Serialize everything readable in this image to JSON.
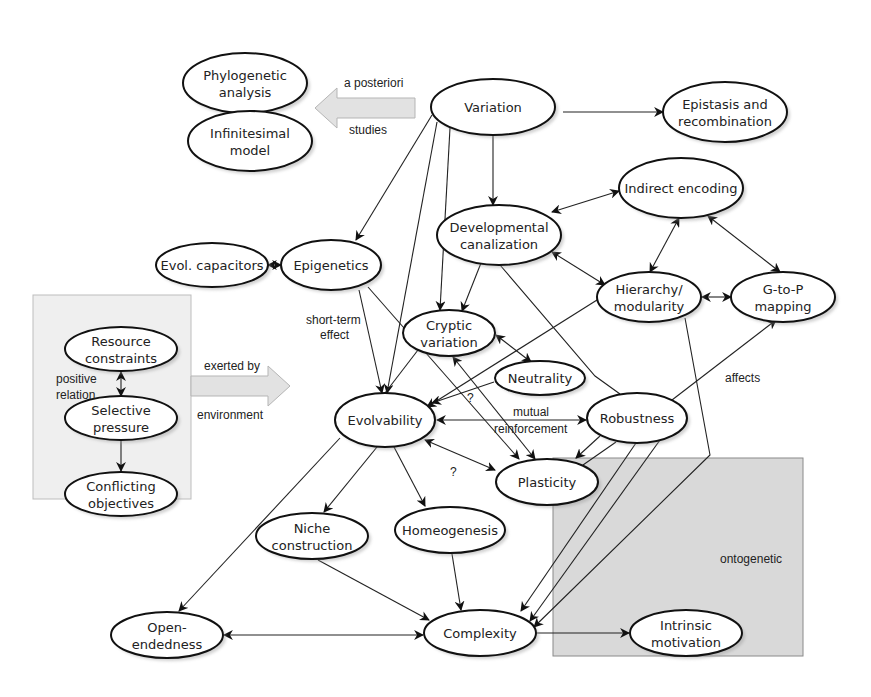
{
  "diagram": {
    "title": "",
    "colors": {
      "background": "#ffffff",
      "node_fill": "#ffffff",
      "node_stroke": "#111111",
      "group_box_fill": "#efefef",
      "ontogenetic_box_fill": "#d9d9d9",
      "block_arrow_fill": "#e2e2e2"
    },
    "nodes": [
      {
        "id": "phylogenetic",
        "lines": [
          "Phylogenetic",
          "analysis"
        ],
        "cx": 245,
        "cy": 83,
        "rx": 62,
        "ry": 30
      },
      {
        "id": "infinitesimal",
        "lines": [
          "Infinitesimal",
          "model"
        ],
        "cx": 250,
        "cy": 141,
        "rx": 62,
        "ry": 30
      },
      {
        "id": "variation",
        "lines": [
          "Variation"
        ],
        "cx": 493,
        "cy": 107,
        "rx": 62,
        "ry": 28
      },
      {
        "id": "epistasis",
        "lines": [
          "Epistasis and",
          "recombination"
        ],
        "cx": 725,
        "cy": 112,
        "rx": 62,
        "ry": 30
      },
      {
        "id": "indirect",
        "lines": [
          "Indirect encoding"
        ],
        "cx": 681,
        "cy": 188,
        "rx": 62,
        "ry": 30
      },
      {
        "id": "canalization",
        "lines": [
          "Developmental",
          "canalization"
        ],
        "cx": 499,
        "cy": 235,
        "rx": 62,
        "ry": 30
      },
      {
        "id": "capacitors",
        "lines": [
          "Evol. capacitors"
        ],
        "cx": 212,
        "cy": 265,
        "rx": 56,
        "ry": 22
      },
      {
        "id": "epigenetics",
        "lines": [
          "Epigenetics"
        ],
        "cx": 331,
        "cy": 265,
        "rx": 50,
        "ry": 25
      },
      {
        "id": "hierarchy",
        "lines": [
          "Hierarchy/",
          "modularity"
        ],
        "cx": 649,
        "cy": 297,
        "rx": 52,
        "ry": 25
      },
      {
        "id": "gtop",
        "lines": [
          "G-to-P",
          "mapping"
        ],
        "cx": 783,
        "cy": 297,
        "rx": 52,
        "ry": 25
      },
      {
        "id": "resource",
        "lines": [
          "Resource",
          "constraints"
        ],
        "cx": 121,
        "cy": 349,
        "rx": 56,
        "ry": 22
      },
      {
        "id": "selective",
        "lines": [
          "Selective",
          "pressure"
        ],
        "cx": 121,
        "cy": 418,
        "rx": 56,
        "ry": 22
      },
      {
        "id": "conflicting",
        "lines": [
          "Conflicting",
          "objectives"
        ],
        "cx": 121,
        "cy": 494,
        "rx": 56,
        "ry": 22
      },
      {
        "id": "cryptic",
        "lines": [
          "Cryptic",
          "variation"
        ],
        "cx": 449,
        "cy": 333,
        "rx": 46,
        "ry": 23
      },
      {
        "id": "neutrality",
        "lines": [
          "Neutrality"
        ],
        "cx": 540,
        "cy": 378,
        "rx": 45,
        "ry": 17
      },
      {
        "id": "evolvability",
        "lines": [
          "Evolvability"
        ],
        "cx": 385,
        "cy": 420,
        "rx": 50,
        "ry": 27
      },
      {
        "id": "robustness",
        "lines": [
          "Robustness"
        ],
        "cx": 637,
        "cy": 418,
        "rx": 50,
        "ry": 25
      },
      {
        "id": "plasticity",
        "lines": [
          "Plasticity"
        ],
        "cx": 547,
        "cy": 482,
        "rx": 51,
        "ry": 23
      },
      {
        "id": "niche",
        "lines": [
          "Niche",
          "construction"
        ],
        "cx": 312,
        "cy": 536,
        "rx": 56,
        "ry": 23
      },
      {
        "id": "homeogenesis",
        "lines": [
          "Homeogenesis"
        ],
        "cx": 450,
        "cy": 530,
        "rx": 55,
        "ry": 23
      },
      {
        "id": "openendedness",
        "lines": [
          "Open-",
          "endedness"
        ],
        "cx": 167,
        "cy": 635,
        "rx": 56,
        "ry": 23
      },
      {
        "id": "complexity",
        "lines": [
          "Complexity"
        ],
        "cx": 480,
        "cy": 633,
        "rx": 56,
        "ry": 23
      },
      {
        "id": "intrinsic",
        "lines": [
          "Intrinsic",
          "motivation"
        ],
        "cx": 686,
        "cy": 633,
        "rx": 56,
        "ry": 23
      }
    ],
    "edges": [
      {
        "from": "variation",
        "to": "epistasis",
        "type": "directed",
        "points": [
          [
            563,
            112
          ],
          [
            663,
            112
          ]
        ]
      },
      {
        "from": "variation",
        "to": "canalization",
        "type": "directed",
        "points": [
          [
            493,
            135
          ],
          [
            493,
            205
          ]
        ]
      },
      {
        "from": "variation",
        "to": "epigenetics",
        "type": "directed",
        "points": [
          [
            432,
            115
          ],
          [
            356,
            240
          ]
        ]
      },
      {
        "from": "variation",
        "to": "cryptic",
        "type": "directed",
        "points": [
          [
            450,
            128
          ],
          [
            440,
            310
          ]
        ]
      },
      {
        "from": "variation",
        "to": "evolvability",
        "type": "directed",
        "points": [
          [
            437,
            122
          ],
          [
            387,
            393
          ]
        ]
      },
      {
        "from": "canalization",
        "to": "indirect",
        "type": "bidirectional",
        "points": [
          [
            552,
            212
          ],
          [
            619,
            191
          ]
        ]
      },
      {
        "from": "canalization",
        "to": "hierarchy",
        "type": "bidirectional",
        "points": [
          [
            552,
            252
          ],
          [
            605,
            285
          ]
        ]
      },
      {
        "from": "canalization",
        "to": "cryptic",
        "type": "directed",
        "points": [
          [
            481,
            263
          ],
          [
            462,
            311
          ]
        ]
      },
      {
        "from": "canalization",
        "to": "plasticity",
        "type": "directed_line",
        "points": [
          [
            500,
            265
          ],
          [
            595,
            376
          ],
          [
            620,
            394
          ]
        ]
      },
      {
        "from": "indirect",
        "to": "hierarchy",
        "type": "bidirectional",
        "points": [
          [
            679,
            218
          ],
          [
            650,
            272
          ]
        ]
      },
      {
        "from": "indirect",
        "to": "gtop",
        "type": "bidirectional",
        "points": [
          [
            708,
            216
          ],
          [
            780,
            272
          ]
        ]
      },
      {
        "from": "hierarchy",
        "to": "gtop",
        "type": "bidirectional",
        "points": [
          [
            702,
            297
          ],
          [
            731,
            297
          ]
        ]
      },
      {
        "from": "hierarchy",
        "to": "evolvability",
        "type": "directed",
        "points": [
          [
            597,
            300
          ],
          [
            427,
            407
          ]
        ]
      },
      {
        "from": "hierarchy",
        "to": "complexity",
        "type": "directed",
        "points": [
          [
            685,
            318
          ],
          [
            710,
            455
          ],
          [
            534,
            627
          ]
        ]
      },
      {
        "from": "capacitors",
        "to": "epigenetics",
        "type": "bidirectional",
        "points": [
          [
            268,
            265
          ],
          [
            281,
            265
          ]
        ]
      },
      {
        "from": "epigenetics",
        "to": "evolvability",
        "type": "directed",
        "points": [
          [
            359,
            290
          ],
          [
            382,
            393
          ]
        ]
      },
      {
        "from": "epigenetics",
        "to": "plasticity",
        "type": "directed",
        "points": [
          [
            368,
            287
          ],
          [
            519,
            459
          ]
        ]
      },
      {
        "from": "cryptic",
        "to": "neutrality",
        "type": "bidirectional",
        "points": [
          [
            496,
            335
          ],
          [
            531,
            362
          ]
        ]
      },
      {
        "from": "cryptic",
        "to": "plasticity",
        "type": "bidirectional",
        "points": [
          [
            453,
            357
          ],
          [
            535,
            459
          ]
        ]
      },
      {
        "from": "cryptic",
        "to": "evolvability",
        "type": "line",
        "points": [
          [
            418,
            350
          ],
          [
            385,
            393
          ]
        ]
      },
      {
        "from": "neutrality",
        "to": "evolvability",
        "type": "directed",
        "points": [
          [
            494,
            382
          ],
          [
            432,
            403
          ]
        ]
      },
      {
        "from": "evolvability",
        "to": "robustness",
        "type": "bidirectional",
        "points": [
          [
            437,
            420
          ],
          [
            586,
            420
          ]
        ]
      },
      {
        "from": "evolvability",
        "to": "plasticity",
        "type": "bidirectional",
        "points": [
          [
            425,
            440
          ],
          [
            495,
            470
          ]
        ]
      },
      {
        "from": "evolvability",
        "to": "niche",
        "type": "directed",
        "points": [
          [
            377,
            447
          ],
          [
            324,
            512
          ]
        ]
      },
      {
        "from": "evolvability",
        "to": "homeogenesis",
        "type": "directed",
        "points": [
          [
            394,
            447
          ],
          [
            425,
            506
          ]
        ]
      },
      {
        "from": "evolvability",
        "to": "openendedness",
        "type": "directed",
        "points": [
          [
            340,
            438
          ],
          [
            179,
            611
          ]
        ]
      },
      {
        "from": "robustness",
        "to": "gtop",
        "type": "directed",
        "points": [
          [
            672,
            400
          ],
          [
            776,
            320
          ]
        ]
      },
      {
        "from": "robustness",
        "to": "plasticity",
        "type": "directed",
        "points": [
          [
            600,
            436
          ],
          [
            576,
            458
          ]
        ]
      },
      {
        "from": "robustness",
        "to": "plasticity2",
        "type": "line",
        "points": [
          [
            616,
            442
          ],
          [
            583,
            465
          ]
        ]
      },
      {
        "from": "robustness",
        "to": "complexity",
        "type": "directed",
        "points": [
          [
            636,
            443
          ],
          [
            521,
            611
          ]
        ]
      },
      {
        "from": "robustness",
        "to": "complexity2",
        "type": "directed",
        "points": [
          [
            660,
            440
          ],
          [
            530,
            621
          ]
        ]
      },
      {
        "from": "niche",
        "to": "complexity",
        "type": "directed",
        "points": [
          [
            318,
            560
          ],
          [
            429,
            620
          ]
        ]
      },
      {
        "from": "homeogenesis",
        "to": "complexity",
        "type": "directed",
        "points": [
          [
            452,
            554
          ],
          [
            461,
            610
          ]
        ]
      },
      {
        "from": "openendedness",
        "to": "complexity",
        "type": "bidirectional",
        "points": [
          [
            224,
            635
          ],
          [
            423,
            635
          ]
        ]
      },
      {
        "from": "complexity",
        "to": "intrinsic",
        "type": "directed",
        "points": [
          [
            537,
            633
          ],
          [
            629,
            633
          ]
        ]
      },
      {
        "from": "resource",
        "to": "selective",
        "type": "bidirectional",
        "points": [
          [
            121,
            372
          ],
          [
            121,
            396
          ]
        ]
      },
      {
        "from": "selective",
        "to": "conflicting",
        "type": "directed",
        "points": [
          [
            121,
            441
          ],
          [
            121,
            471
          ]
        ]
      }
    ],
    "edge_labels": [
      {
        "id": "a-posteriori",
        "text": "a posteriori",
        "x": 344,
        "y": 87
      },
      {
        "id": "studies",
        "text": "studies",
        "x": 349,
        "y": 134
      },
      {
        "id": "short-term-1",
        "text": "short-term",
        "x": 306,
        "y": 324
      },
      {
        "id": "short-term-2",
        "text": "effect",
        "x": 320,
        "y": 339
      },
      {
        "id": "exerted-by",
        "text": "exerted by",
        "x": 204,
        "y": 370
      },
      {
        "id": "environment",
        "text": "environment",
        "x": 197,
        "y": 419
      },
      {
        "id": "positive",
        "text": "positive",
        "x": 56,
        "y": 383
      },
      {
        "id": "relation",
        "text": "relation",
        "x": 56,
        "y": 399
      },
      {
        "id": "mutual",
        "text": "mutual",
        "x": 513,
        "y": 416
      },
      {
        "id": "reinforcement",
        "text": "reinforcement",
        "x": 494,
        "y": 433
      },
      {
        "id": "question-1",
        "text": "?",
        "x": 467,
        "y": 402
      },
      {
        "id": "question-2",
        "text": "?",
        "x": 450,
        "y": 476
      },
      {
        "id": "affects",
        "text": "affects",
        "x": 725,
        "y": 382
      },
      {
        "id": "ontogenetic",
        "text": "ontogenetic",
        "x": 720,
        "y": 563
      }
    ],
    "groups": [
      {
        "id": "selection-box",
        "x": 33,
        "y": 295,
        "w": 158,
        "h": 204
      },
      {
        "id": "ontogenetic-box",
        "x": 553,
        "y": 458,
        "w": 250,
        "h": 198
      }
    ],
    "block_arrows": [
      {
        "id": "a-posteriori-arrow",
        "direction": "left",
        "x1": 415,
        "x2": 315,
        "y": 108
      },
      {
        "id": "exerted-by-arrow",
        "direction": "right",
        "x1": 191,
        "x2": 290,
        "y": 386
      }
    ]
  }
}
